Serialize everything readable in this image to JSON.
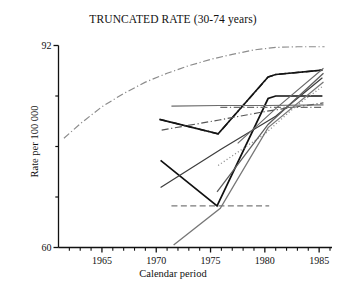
{
  "chart_data": {
    "type": "line",
    "title": "TRUNCATED RATE (30-74 years)",
    "xlabel": "Calendar period",
    "ylabel": "Rate per 100 000",
    "xlim": [
      1961,
      1986
    ],
    "ylim": [
      60,
      92
    ],
    "grid": false,
    "legend": "none",
    "x_ticks_major": [
      1965,
      1970,
      1975,
      1980,
      1985
    ],
    "x_tick_labels": [
      "1965",
      "1970",
      "1975",
      "1980",
      "1985"
    ],
    "x_ticks_minor": [
      1962,
      1963,
      1964,
      1966,
      1967,
      1968,
      1969,
      1971,
      1972,
      1973,
      1974,
      1976,
      1977,
      1978,
      1979,
      1981,
      1982,
      1983,
      1984,
      1986
    ],
    "y_ticks_major": [
      60,
      92
    ],
    "y_tick_labels": [
      "60",
      "92"
    ],
    "y_ticks_minor": [
      68,
      76,
      84
    ],
    "series": [
      {
        "name": "series-1",
        "style": "dashdot",
        "color": "#8c8c8c",
        "width": 1.2,
        "x": [
          1961.5,
          1963,
          1965,
          1967,
          1969,
          1971,
          1973,
          1975,
          1977,
          1979,
          1981,
          1983,
          1985.5
        ],
        "y": [
          77.3,
          79.6,
          82.3,
          84.4,
          86.2,
          87.6,
          88.8,
          89.8,
          90.6,
          91.3,
          91.7,
          91.8,
          91.8
        ]
      },
      {
        "name": "series-2",
        "style": "dashdot",
        "color": "#2b2b2b",
        "width": 1.5,
        "x": [
          1970.3,
          1975.7,
          1980.3,
          1981.0,
          1985.3
        ],
        "y": [
          80.3,
          78.0,
          87.0,
          87.4,
          88.1
        ]
      },
      {
        "name": "series-3",
        "style": "solid",
        "color": "#141414",
        "width": 1.6,
        "x": [
          1970.3,
          1975.7,
          1980.3,
          1981.0,
          1985.3
        ],
        "y": [
          80.3,
          78.0,
          87.0,
          87.4,
          88.1
        ]
      },
      {
        "name": "series-4",
        "style": "solid",
        "color": "#111111",
        "width": 1.7,
        "x": [
          1970.4,
          1975.6,
          1980.3,
          1981.0,
          1985.3
        ],
        "y": [
          73.8,
          66.6,
          83.6,
          84.0,
          84.0
        ]
      },
      {
        "name": "series-5",
        "style": "solid",
        "color": "#3d3d3d",
        "width": 1.2,
        "x": [
          1970.4,
          1976.0,
          1981.0,
          1985.3
        ],
        "y": [
          69.5,
          75.6,
          80.8,
          86.9
        ]
      },
      {
        "name": "series-6",
        "style": "dashdot",
        "color": "#555555",
        "width": 1.2,
        "x": [
          1970.5,
          1975.8,
          1980.2,
          1985.4
        ],
        "y": [
          78.6,
          80.2,
          81.6,
          82.9
        ]
      },
      {
        "name": "series-7",
        "style": "solid",
        "color": "#6b6b6b",
        "width": 1.1,
        "x": [
          1971.4,
          1975.8,
          1980.2,
          1985.4
        ],
        "y": [
          82.4,
          82.5,
          82.5,
          82.6
        ]
      },
      {
        "name": "series-8",
        "style": "dashed",
        "color": "#7a7a7a",
        "width": 1.4,
        "x": [
          1971.4,
          1976.0,
          1980.4
        ],
        "y": [
          66.6,
          66.6,
          66.6
        ]
      },
      {
        "name": "series-9",
        "style": "dashdot",
        "color": "#6e6e6e",
        "width": 1.1,
        "x": [
          1975.9,
          1980.3,
          1985.4
        ],
        "y": [
          82.2,
          82.2,
          82.2
        ]
      },
      {
        "name": "series-10",
        "style": "dotted",
        "color": "#909090",
        "width": 1.3,
        "x": [
          1975.7,
          1980.0,
          1983.0,
          1985.3
        ],
        "y": [
          73.0,
          78.0,
          82.6,
          85.5
        ]
      },
      {
        "name": "series-11",
        "style": "solid",
        "color": "#777777",
        "width": 1.3,
        "x": [
          1971.6,
          1975.9,
          1980.3,
          1985.4
        ],
        "y": [
          60.4,
          66.2,
          79.0,
          86.2
        ]
      },
      {
        "name": "series-12",
        "style": "solid",
        "color": "#5e5e5e",
        "width": 1.3,
        "x": [
          1975.6,
          1980.3,
          1985.4
        ],
        "y": [
          68.8,
          79.5,
          87.6
        ]
      },
      {
        "name": "series-13",
        "style": "solid",
        "color": "#6a6a6a",
        "width": 1.1,
        "x": [
          1977.5,
          1981.0,
          1985.4
        ],
        "y": [
          76.5,
          82.0,
          88.4
        ]
      }
    ]
  }
}
